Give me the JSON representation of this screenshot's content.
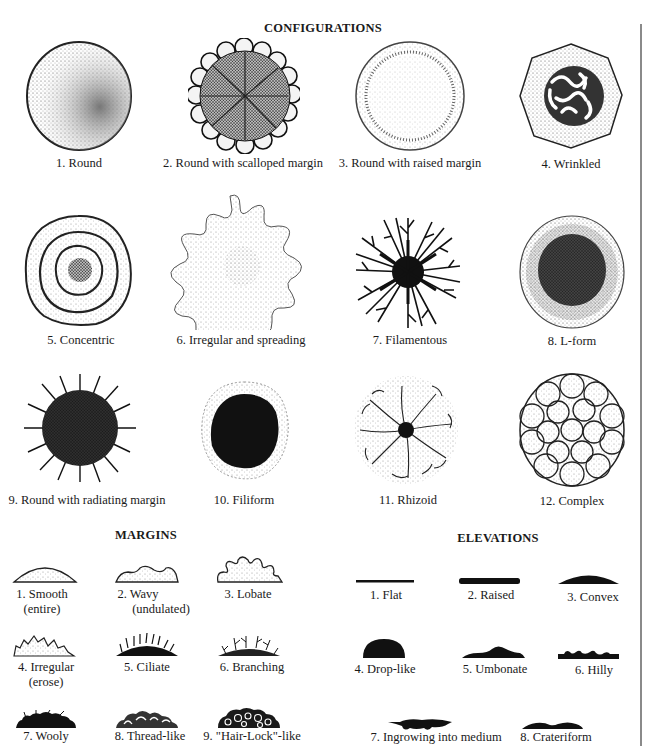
{
  "configurations": {
    "title": "CONFIGURATIONS",
    "items": [
      {
        "label": "1. Round"
      },
      {
        "label": "2. Round with scalloped margin"
      },
      {
        "label": "3. Round with raised margin"
      },
      {
        "label": "4. Wrinkled"
      },
      {
        "label": "5. Concentric"
      },
      {
        "label": "6. Irregular and spreading"
      },
      {
        "label": "7. Filamentous"
      },
      {
        "label": "8. L-form"
      },
      {
        "label": "9. Round with radiating margin"
      },
      {
        "label": "10. Filiform"
      },
      {
        "label": "11. Rhizoid"
      },
      {
        "label": "12. Complex"
      }
    ]
  },
  "margins": {
    "title": "MARGINS",
    "items": [
      {
        "label": "1. Smooth",
        "sub": "(entire)"
      },
      {
        "label": "2. Wavy",
        "sub": "(undulated)"
      },
      {
        "label": "3. Lobate"
      },
      {
        "label": "4. Irregular",
        "sub": "(erose)"
      },
      {
        "label": "5. Ciliate"
      },
      {
        "label": "6. Branching"
      },
      {
        "label": "7. Wooly"
      },
      {
        "label": "8. Thread-like"
      },
      {
        "label": "9. \"Hair-Lock\"-like"
      }
    ]
  },
  "elevations": {
    "title": "ELEVATIONS",
    "items": [
      {
        "label": "1. Flat"
      },
      {
        "label": "2. Raised"
      },
      {
        "label": "3. Convex"
      },
      {
        "label": "4. Drop-like"
      },
      {
        "label": "5. Umbonate"
      },
      {
        "label": "6. Hilly"
      },
      {
        "label": "7. Ingrowing into medium"
      },
      {
        "label": "8. Crateriform"
      }
    ]
  }
}
